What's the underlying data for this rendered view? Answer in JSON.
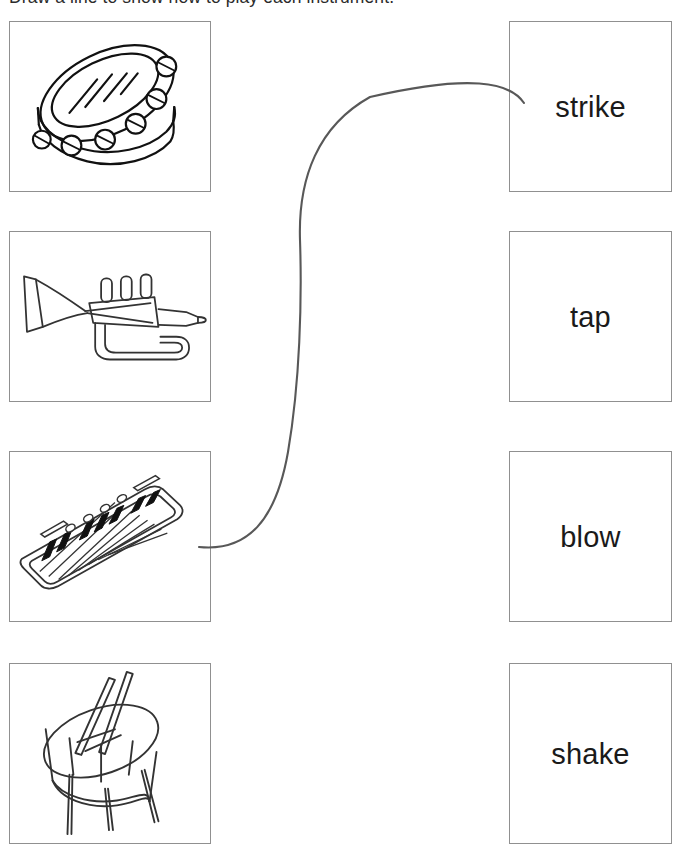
{
  "worksheet": {
    "title": "Draw a line to show how to play each instrument.",
    "page_width": 682,
    "page_height": 855,
    "background_color": "#ffffff",
    "box_border_color": "#909090",
    "ink_color": "#1a1a1a",
    "match_line_color": "#585858"
  },
  "instruments": [
    {
      "icon": "tambourine-icon",
      "name": "tambourine",
      "alt": "Line drawing of a tambourine with jingles around the rim"
    },
    {
      "icon": "trumpet-icon",
      "name": "trumpet",
      "alt": "Line drawing of a trumpet with three valves"
    },
    {
      "icon": "keyboard-icon",
      "name": "keyboard",
      "alt": "Line drawing of an electronic keyboard with black and white keys"
    },
    {
      "icon": "drum-icon",
      "name": "drum",
      "alt": "Line drawing of a drum on a stand with two drumsticks"
    }
  ],
  "actions": [
    {
      "label": "strike"
    },
    {
      "label": "tap"
    },
    {
      "label": "blow"
    },
    {
      "label": "shake"
    }
  ],
  "match_lines": [
    {
      "from": "keyboard",
      "to": "strike",
      "start_x": 199,
      "start_y": 547,
      "end_x": 524,
      "end_y": 103
    }
  ]
}
